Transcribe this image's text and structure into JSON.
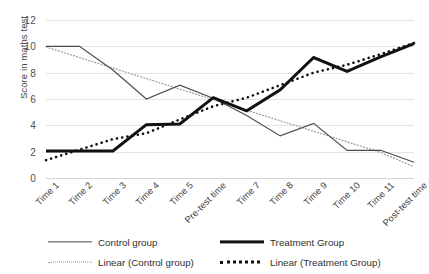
{
  "chart_data": {
    "type": "line",
    "title": "",
    "xlabel": "",
    "ylabel": "Score in maths test",
    "ylim": [
      0,
      12
    ],
    "ytick_step": 2,
    "yticks": [
      0,
      2,
      4,
      6,
      8,
      10,
      12
    ],
    "grid": true,
    "legend_position": "bottom",
    "categories": [
      "Time 1",
      "Time 2",
      "Time 3",
      "Time 4",
      "Time 5",
      "Pre-test time",
      "Time 7",
      "Time 8",
      "Time 9",
      "Time 10",
      "Time 11",
      "Post-test time"
    ],
    "series": [
      {
        "name": "Control group",
        "style": "solid-thin",
        "color": "#4a4a4a",
        "values": [
          10.0,
          10.0,
          8.2,
          6.0,
          7.05,
          6.05,
          4.75,
          3.2,
          4.15,
          2.1,
          2.1,
          1.2
        ]
      },
      {
        "name": "Treatment Group",
        "style": "solid-thick",
        "color": "#111111",
        "values": [
          2.05,
          2.05,
          2.05,
          4.05,
          4.1,
          6.1,
          5.1,
          6.7,
          9.15,
          8.1,
          9.2,
          10.2
        ]
      },
      {
        "name": "Linear (Control group)",
        "style": "dotted-thin",
        "color": "#9a9a9a",
        "trendline_for": "Control group",
        "values": [
          9.95,
          9.15,
          8.35,
          7.55,
          6.75,
          5.95,
          5.15,
          4.35,
          3.55,
          2.75,
          1.95,
          0.85
        ]
      },
      {
        "name": "Linear (Treatment Group)",
        "style": "dotted-thick",
        "color": "#111111",
        "trendline_for": "Treatment Group",
        "values": [
          1.35,
          2.15,
          2.95,
          3.4,
          4.45,
          5.45,
          6.1,
          7.05,
          8.0,
          8.6,
          9.4,
          10.25
        ]
      }
    ]
  },
  "legend": {
    "items": [
      {
        "label": "Control group",
        "key": "k-control"
      },
      {
        "label": "Treatment Group",
        "key": "k-treatment"
      },
      {
        "label": "Linear (Control group)",
        "key": "k-lin-control"
      },
      {
        "label": "Linear (Treatment Group)",
        "key": "k-lin-treatment"
      }
    ]
  }
}
